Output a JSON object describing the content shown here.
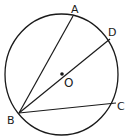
{
  "diagram": {
    "type": "circle-geometry",
    "colors": {
      "stroke": "#1a1a1a",
      "background": "#ffffff"
    },
    "circle": {
      "cx": 61.5,
      "cy": 74.5,
      "rx": 56.5,
      "ry": 60.5
    },
    "center": {
      "label": "O",
      "x": 62,
      "y": 74
    },
    "points": [
      {
        "label": "A",
        "x": 73,
        "y": 16
      },
      {
        "label": "D",
        "x": 110,
        "y": 39
      },
      {
        "label": "C",
        "x": 116,
        "y": 103
      },
      {
        "label": "B",
        "x": 19,
        "y": 113
      }
    ],
    "segments": [
      {
        "from": "B",
        "to": "A"
      },
      {
        "from": "B",
        "to": "D"
      },
      {
        "from": "B",
        "to": "C"
      }
    ],
    "labels": {
      "A": "A",
      "D": "D",
      "C": "C",
      "B": "B",
      "O": "O"
    }
  }
}
